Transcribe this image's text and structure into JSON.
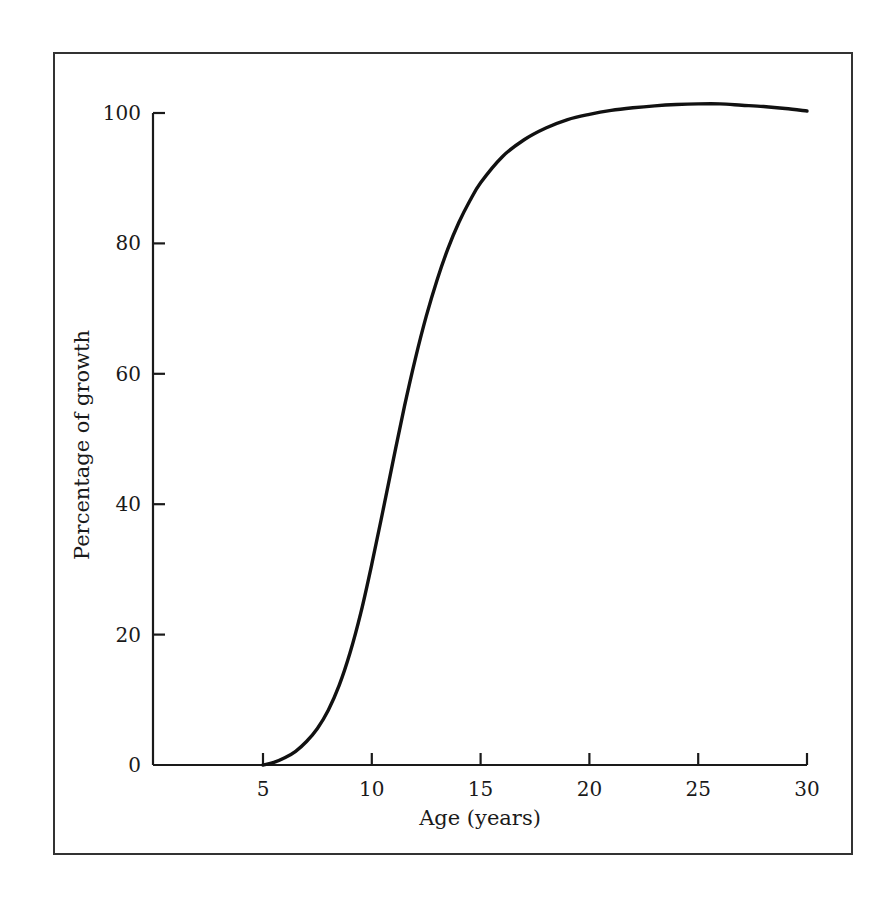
{
  "chart_data": {
    "type": "line",
    "title": "",
    "subtitle": "",
    "xlabel": "Age (years)",
    "ylabel": "Percentage of growth",
    "xlim": [
      2.5,
      30
    ],
    "ylim": [
      0,
      104
    ],
    "xticks": [
      5,
      10,
      15,
      20,
      25,
      30
    ],
    "xtick_labels": [
      "5",
      "10",
      "15",
      "20",
      "25",
      "30"
    ],
    "yticks": [
      0,
      20,
      40,
      60,
      80,
      100
    ],
    "ytick_labels": [
      "0",
      "20",
      "40",
      "60",
      "80",
      "100"
    ],
    "grid": false,
    "legend": null,
    "annotations": [],
    "series": [
      {
        "name": "Percentage of growth",
        "color": "#111111",
        "line_width": 3,
        "x": [
          5.0,
          5.5,
          6.0,
          6.5,
          7.0,
          7.5,
          8.0,
          8.5,
          9.0,
          9.5,
          10.0,
          10.5,
          11.0,
          11.5,
          12.0,
          12.5,
          13.0,
          13.5,
          14.0,
          14.5,
          15.0,
          16.0,
          17.0,
          18.0,
          19.0,
          20.0,
          21.0,
          22.0,
          23.0,
          24.0,
          25.0,
          26.0,
          27.0,
          28.0,
          29.0,
          30.0
        ],
        "y": [
          0.0,
          0.4,
          1.1,
          2.1,
          3.6,
          5.6,
          8.4,
          12.2,
          17.2,
          23.4,
          30.8,
          38.8,
          47.0,
          55.0,
          62.3,
          68.8,
          74.4,
          79.2,
          83.2,
          86.5,
          89.3,
          93.3,
          95.9,
          97.7,
          99.0,
          99.8,
          100.4,
          100.8,
          101.1,
          101.3,
          101.4,
          101.4,
          101.2,
          101.0,
          100.7,
          100.3
        ]
      }
    ]
  },
  "axes": {
    "x_axis_title": "Age (years)",
    "y_axis_title": "Percentage of growth",
    "x_tick_labels": [
      "5",
      "10",
      "15",
      "20",
      "25",
      "30"
    ],
    "y_tick_labels": [
      "0",
      "20",
      "40",
      "60",
      "80",
      "100"
    ]
  },
  "colors": {
    "curve": "#111111",
    "axis": "#1a1a1a",
    "frame": "#333333",
    "background": "#ffffff"
  }
}
